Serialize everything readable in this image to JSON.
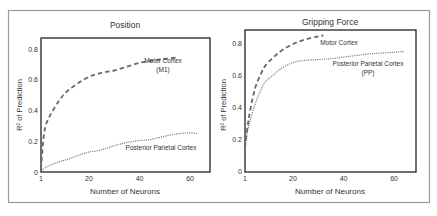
{
  "figure": {
    "border_color": "#9a9a9a",
    "frame_color": "#222222",
    "line_color": "#6a6a6a"
  },
  "chart_data": [
    {
      "type": "line",
      "title": "Position",
      "xlabel": "Number of Neurons",
      "ylabel": "R² of Prediction",
      "xticks": [
        1,
        20,
        40,
        60
      ],
      "yticks": [
        0,
        0.2,
        0.4,
        0.6,
        0.8
      ],
      "xlim": [
        1,
        66
      ],
      "ylim": [
        0,
        0.87
      ],
      "grid": false,
      "series": [
        {
          "name": "Motor Cortex (M1)",
          "label_lines": [
            "Motor Cortex",
            "(M1)"
          ],
          "style": "dashed",
          "x": [
            1,
            2,
            3,
            5,
            8,
            11,
            15,
            20,
            25,
            30,
            35,
            40,
            45,
            50,
            55
          ],
          "y": [
            0.02,
            0.22,
            0.31,
            0.38,
            0.46,
            0.52,
            0.57,
            0.62,
            0.645,
            0.66,
            0.685,
            0.71,
            0.725,
            0.735,
            0.745
          ]
        },
        {
          "name": "Posterior Parietal Cortex",
          "label_lines": [
            "Posterior Parietal Cortex"
          ],
          "style": "dotted",
          "x": [
            1,
            4,
            8,
            12,
            16,
            20,
            24,
            28,
            32,
            36,
            40,
            44,
            48,
            52,
            56,
            60,
            63
          ],
          "y": [
            0.01,
            0.04,
            0.065,
            0.085,
            0.11,
            0.13,
            0.14,
            0.16,
            0.18,
            0.195,
            0.205,
            0.21,
            0.225,
            0.24,
            0.25,
            0.255,
            0.25
          ]
        }
      ]
    },
    {
      "type": "line",
      "title": "Gripping Force",
      "xlabel": "Number of Neurons",
      "ylabel": "R² of Prediction",
      "xticks": [
        1,
        20,
        40,
        60
      ],
      "yticks": [
        0,
        0.2,
        0.4,
        0.6,
        0.8
      ],
      "xlim": [
        1,
        66
      ],
      "ylim": [
        0,
        0.92
      ],
      "grid": false,
      "series": [
        {
          "name": "Motor Cortex",
          "label_lines": [
            "Motor Cortex"
          ],
          "style": "dashed",
          "x": [
            1,
            2,
            3,
            5,
            7,
            9,
            12,
            15,
            18,
            22,
            26,
            30,
            32
          ],
          "y": [
            0.15,
            0.28,
            0.38,
            0.52,
            0.6,
            0.66,
            0.71,
            0.75,
            0.78,
            0.81,
            0.83,
            0.845,
            0.85
          ]
        },
        {
          "name": "Posterior Parietal Cortex (PP)",
          "label_lines": [
            "Posterior Parietal Cortex",
            "(PP)"
          ],
          "style": "dotted",
          "x": [
            1,
            2,
            3,
            5,
            7,
            9,
            12,
            15,
            20,
            25,
            30,
            35,
            40,
            45,
            50,
            55,
            60,
            64
          ],
          "y": [
            0.15,
            0.25,
            0.32,
            0.42,
            0.5,
            0.56,
            0.6,
            0.64,
            0.68,
            0.695,
            0.7,
            0.705,
            0.715,
            0.725,
            0.735,
            0.74,
            0.745,
            0.75
          ]
        }
      ]
    }
  ]
}
